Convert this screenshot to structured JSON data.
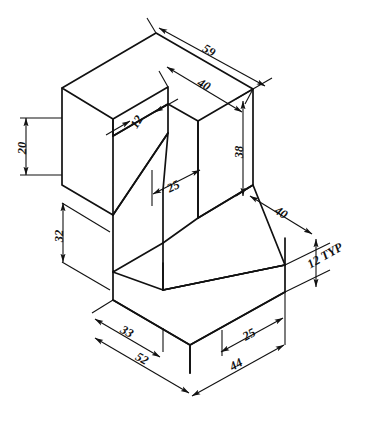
{
  "drawing": {
    "type": "isometric-engineering-drawing",
    "title": "",
    "units": "mm",
    "line_color": "#111111",
    "background_color": "#ffffff",
    "dimensions": [
      {
        "id": "d59",
        "label": "59",
        "x": 207,
        "y": 54,
        "rotate": 30,
        "orientation": "iso-right-down",
        "measures": "overall top rear length"
      },
      {
        "id": "d40t",
        "label": "40",
        "x": 202,
        "y": 88,
        "rotate": 30,
        "orientation": "iso-right-down",
        "measures": "top face depth"
      },
      {
        "id": "d12n",
        "label": "12",
        "x": 139,
        "y": 122,
        "rotate": -58,
        "orientation": "iso-left-down",
        "measures": "notch width"
      },
      {
        "id": "d20",
        "label": "20",
        "x": 26,
        "y": 144,
        "rotate": -90,
        "orientation": "vertical",
        "measures": "upper left height"
      },
      {
        "id": "d38",
        "label": "38",
        "x": 242,
        "y": 153,
        "rotate": -90,
        "orientation": "vertical",
        "measures": "right face height"
      },
      {
        "id": "d25u",
        "label": "25",
        "x": 170,
        "y": 190,
        "rotate": 0,
        "orientation": "horizontal",
        "measures": "slot depth"
      },
      {
        "id": "d40r",
        "label": "40",
        "x": 282,
        "y": 219,
        "rotate": -58,
        "orientation": "iso-right-down",
        "measures": "base right depth"
      },
      {
        "id": "d32",
        "label": "32",
        "x": 64,
        "y": 237,
        "rotate": -90,
        "orientation": "vertical",
        "measures": "lower left height"
      },
      {
        "id": "d12t",
        "label": "12 TYP",
        "x": 322,
        "y": 259,
        "rotate": -30,
        "orientation": "iso-right-down",
        "measures": "base plate thickness typical"
      },
      {
        "id": "d33",
        "label": "33",
        "x": 124,
        "y": 335,
        "rotate": 30,
        "orientation": "iso-right-down",
        "measures": "left base segment"
      },
      {
        "id": "d25l",
        "label": "25",
        "x": 251,
        "y": 338,
        "rotate": -30,
        "orientation": "iso-right-up",
        "measures": "right base segment"
      },
      {
        "id": "d52",
        "label": "52",
        "x": 139,
        "y": 362,
        "rotate": 30,
        "orientation": "iso-right-down",
        "measures": "overall left base length"
      },
      {
        "id": "d44",
        "label": "44",
        "x": 238,
        "y": 366,
        "rotate": -30,
        "orientation": "iso-right-up",
        "measures": "overall right base length"
      }
    ]
  }
}
